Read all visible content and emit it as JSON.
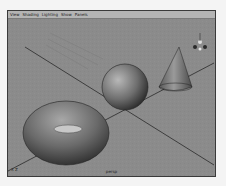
{
  "menubar": {
    "items": [
      {
        "label": "View"
      },
      {
        "label": "Shading"
      },
      {
        "label": "Lighting"
      },
      {
        "label": "Show"
      },
      {
        "label": "Panels"
      }
    ]
  },
  "viewport": {
    "camera_label": "persp",
    "axis_indicator": "X  Z",
    "objects": [
      "torus",
      "sphere",
      "cone"
    ],
    "gizmo": "view-axis-gizmo"
  },
  "colors": {
    "background": "#8b8b8b",
    "menubar": "#b4b4b4",
    "grid_line": "#2a2a2a"
  }
}
